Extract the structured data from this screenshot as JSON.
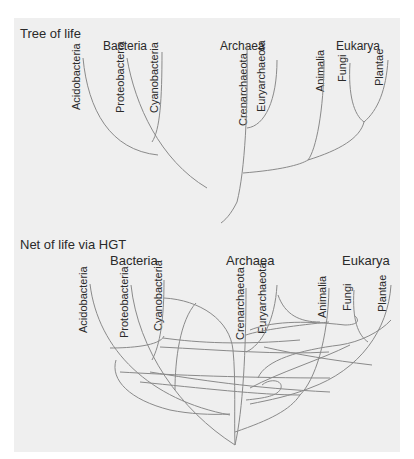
{
  "figure": {
    "background": "#efefef",
    "line_color": "#8a8a8a",
    "text_color": "#2a2a2a"
  },
  "tree": {
    "title": "Tree of life",
    "domains": {
      "bacteria": "Bacteria",
      "archaea": "Archaea",
      "eukarya": "Eukarya"
    },
    "leaves": {
      "acidobacteria": "Acidobacteria",
      "proteobacteria": "Proteobacteria",
      "cyanobacteria": "Cyanobacteria",
      "crenarchaeota": "Crenarchaeota",
      "euryarchaeota": "Euryarchaeota",
      "animalia": "Animalia",
      "fungi": "Fungi",
      "plantae": "Plantae"
    }
  },
  "net": {
    "title": "Net of life via HGT",
    "domains": {
      "bacteria": "Bacteria",
      "archaea": "Archaea",
      "eukarya": "Eukarya"
    },
    "leaves": {
      "acidobacteria": "Acidobacteria",
      "proteobacteria": "Proteobacteria",
      "cyanobacteria": "Cyanobacteria",
      "crenarchaeota": "Crenarchaeota",
      "euryarchaeota": "Euryarchaeota",
      "animalia": "Animalia",
      "fungi": "Fungi",
      "plantae": "Plantae"
    }
  }
}
